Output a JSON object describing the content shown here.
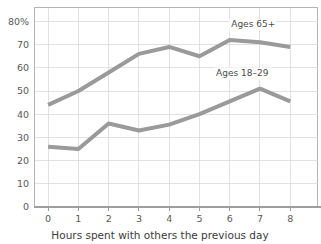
{
  "chart_data": {
    "type": "line",
    "title": "",
    "xlabel": "Hours spent with others the previous day",
    "ylabel": "",
    "x": [
      0,
      1,
      2,
      3,
      4,
      5,
      6,
      7,
      8
    ],
    "xtick_labels": [
      "0",
      "1",
      "2",
      "3",
      "4",
      "5",
      "6",
      "7",
      "8"
    ],
    "ytick_labels": [
      "0",
      "10",
      "20",
      "30",
      "40",
      "50",
      "60",
      "70",
      "80%"
    ],
    "ytick_values": [
      0,
      10,
      20,
      30,
      40,
      50,
      60,
      70,
      80
    ],
    "ylim": [
      0,
      86
    ],
    "xlim": [
      -0.45,
      8.9
    ],
    "grid": true,
    "legend_position": "inline-annotations",
    "series": [
      {
        "name": "Ages 65+",
        "label": "Ages 65+",
        "color": "#9a9a9a",
        "values": [
          44,
          50,
          58,
          66,
          69,
          65,
          72,
          71,
          69
        ]
      },
      {
        "name": "Ages 18-29",
        "label": "Ages 18–29",
        "color": "#9a9a9a",
        "values": [
          26,
          25,
          36,
          33,
          35.5,
          40,
          45.5,
          51,
          45.5
        ]
      }
    ],
    "annotations": [
      {
        "text": "Ages 65+",
        "x": 6.05,
        "y": 77.5
      },
      {
        "text": "Ages 18–29",
        "x": 5.55,
        "y": 56.5
      }
    ],
    "colors": {
      "line": "#9a9a9a",
      "grid": "#d9d9d9",
      "plot_border": "#b3b3b3",
      "axis": "#9e9e9e",
      "text": "#4a4a4a",
      "background": "#ffffff"
    }
  }
}
